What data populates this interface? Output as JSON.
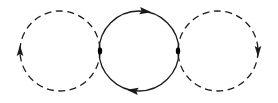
{
  "figure": {
    "width": 278,
    "height": 103,
    "background_color": "#ffffff",
    "stroke_color": "#1a1a1a",
    "vertex_color": "#000000"
  },
  "chart_data": {
    "type": "diagram",
    "xlabel": "",
    "ylabel": "",
    "xlim": [
      0,
      278
    ],
    "ylim": [
      0,
      103
    ],
    "grid": false,
    "legend": "none",
    "units": "pixels",
    "loops": [
      {
        "name": "left-loop",
        "line_style": "dashed",
        "cx": 60,
        "cy": 51,
        "r": 40,
        "stroke_width": 1.3,
        "dash_pattern": "7 4.5",
        "arrow": {
          "name": "left-loop-arrowhead",
          "position_deg": 180,
          "x": 20,
          "y": 51,
          "direction": "up",
          "rotation_deg": -90,
          "size": 11
        }
      },
      {
        "name": "middle-loop",
        "line_style": "solid",
        "cx": 139,
        "cy": 51,
        "r": 40,
        "stroke_width": 1.3,
        "dash_pattern": "none",
        "arrows": [
          {
            "name": "middle-loop-top-arrowhead",
            "position_deg": 270,
            "x": 145,
            "y": 11.4,
            "direction": "right",
            "rotation_deg": 8,
            "size": 12
          },
          {
            "name": "middle-loop-bottom-arrowhead",
            "position_deg": 90,
            "x": 133,
            "y": 90.6,
            "direction": "left",
            "rotation_deg": 188,
            "size": 12
          }
        ],
        "circulation": "clockwise"
      },
      {
        "name": "right-loop",
        "line_style": "dashed",
        "cx": 218,
        "cy": 51,
        "r": 40,
        "stroke_width": 1.3,
        "dash_pattern": "7 4.5",
        "arrow": {
          "name": "right-loop-arrowhead",
          "position_deg": 0,
          "x": 258,
          "y": 51,
          "direction": "down",
          "rotation_deg": 90,
          "size": 11
        }
      }
    ],
    "vertices": [
      {
        "name": "left-vertex",
        "x": 100,
        "y": 51,
        "rx": 2.2,
        "ry": 3.4
      },
      {
        "name": "right-vertex",
        "x": 178,
        "y": 51,
        "rx": 2.2,
        "ry": 3.4
      }
    ]
  }
}
